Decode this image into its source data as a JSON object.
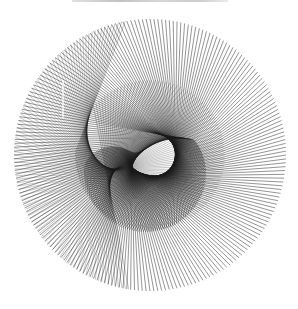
{
  "caption": {
    "text": ""
  },
  "artwork": {
    "type": "string-art",
    "background": "#ffffff",
    "stroke": "#1a1a1a",
    "circle": {
      "cx": 150,
      "cy": 155,
      "r": 136
    },
    "focus": {
      "x": 130,
      "y": 180
    },
    "ray_count": 220,
    "inner_curve": {
      "cx": 148,
      "cy": 150,
      "r_base": 30,
      "r_growth": 52
    },
    "vertical_mark": {
      "x1": 63,
      "y1": 80,
      "x2": 63,
      "y2": 118
    }
  }
}
